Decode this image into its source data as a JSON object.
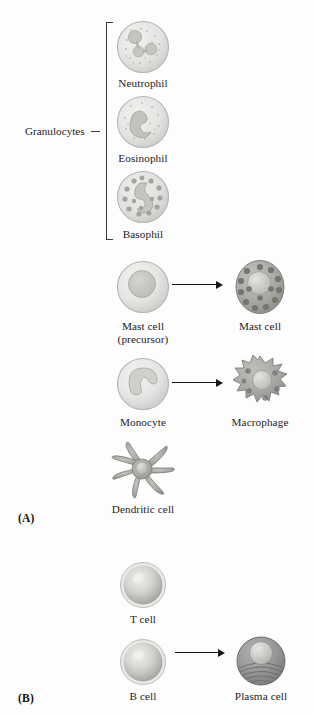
{
  "figure": {
    "panels": [
      {
        "id": "A",
        "label": "(A)"
      },
      {
        "id": "B",
        "label": "(B)"
      }
    ],
    "group": {
      "label": "Granulocytes"
    },
    "cells": {
      "neutrophil": "Neutrophil",
      "eosinophil": "Eosinophil",
      "basophil": "Basophil",
      "mast_precursor": "Mast cell\n(precursor)",
      "mast_mature": "Mast cell",
      "monocyte": "Monocyte",
      "macrophage": "Macrophage",
      "dendritic": "Dendritic cell",
      "tcell": "T cell",
      "bcell": "B cell",
      "plasma": "Plasma cell"
    }
  },
  "colors": {
    "background": "#fdfdfd",
    "text": "#23221f",
    "line": "#3a3a38",
    "arrow": "#15151a",
    "cell_pale_fill": "#e4e4e2",
    "cell_pale_rim": "#b9b9b6",
    "nucleus_light": "#c9c9c6",
    "granule_light": "#b5b5b2",
    "cell_dark_fill": "#a9a9a6",
    "granule_dark": "#7c7c79",
    "sphere_light": "#d6d6d4",
    "plasma_fill": "#8f8f8d"
  }
}
